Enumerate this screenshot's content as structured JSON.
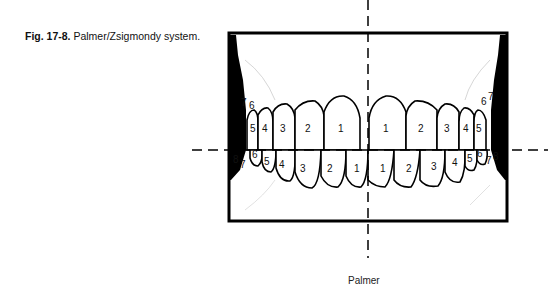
{
  "figure": {
    "number": "Fig. 17-8.",
    "title": "Palmer/Zsigmondy system."
  },
  "diagram": {
    "system_label": "Palmer",
    "upper_right_numbers": [
      "7",
      "6",
      "5",
      "4",
      "3",
      "2",
      "1"
    ],
    "upper_left_numbers": [
      "1",
      "2",
      "3",
      "4",
      "5",
      "6",
      "7"
    ],
    "lower_right_numbers": [
      "8",
      "7",
      "6",
      "5",
      "4",
      "3",
      "2",
      "1"
    ],
    "lower_left_numbers": [
      "1",
      "2",
      "3",
      "4",
      "5",
      "6",
      "7",
      "8"
    ],
    "upper": {
      "right": [
        {
          "n": "7",
          "x": 243,
          "y": 103
        },
        {
          "n": "6",
          "x": 252,
          "y": 107
        },
        {
          "n": "5",
          "x": 255,
          "y": 131
        },
        {
          "n": "4",
          "x": 265,
          "y": 131
        },
        {
          "n": "3",
          "x": 283,
          "y": 131
        },
        {
          "n": "2",
          "x": 308,
          "y": 131
        },
        {
          "n": "1",
          "x": 341,
          "y": 131
        }
      ],
      "left": [
        {
          "n": "1",
          "x": 384,
          "y": 131
        },
        {
          "n": "2",
          "x": 423,
          "y": 131
        },
        {
          "n": "3",
          "x": 450,
          "y": 131
        },
        {
          "n": "4",
          "x": 465,
          "y": 131
        },
        {
          "n": "5",
          "x": 478,
          "y": 131
        },
        {
          "n": "6",
          "x": 481,
          "y": 104
        },
        {
          "n": "7",
          "x": 488,
          "y": 100
        }
      ]
    },
    "lower": {
      "right": [
        {
          "n": "8",
          "x": 235,
          "y": 163
        },
        {
          "n": "7",
          "x": 242,
          "y": 167
        },
        {
          "n": "6",
          "x": 254,
          "y": 157
        },
        {
          "n": "5",
          "x": 264,
          "y": 164
        },
        {
          "n": "4",
          "x": 279,
          "y": 166
        },
        {
          "n": "3",
          "x": 300,
          "y": 172
        },
        {
          "n": "2",
          "x": 327,
          "y": 170
        },
        {
          "n": "1",
          "x": 354,
          "y": 170
        }
      ],
      "left": [
        {
          "n": "1",
          "x": 382,
          "y": 170
        },
        {
          "n": "2",
          "x": 408,
          "y": 170
        },
        {
          "n": "3",
          "x": 432,
          "y": 168
        },
        {
          "n": "4",
          "x": 458,
          "y": 164
        },
        {
          "n": "5",
          "x": 467,
          "y": 161
        },
        {
          "n": "6",
          "x": 478,
          "y": 155
        },
        {
          "n": "7",
          "x": 487,
          "y": 163
        },
        {
          "n": "8",
          "x": 493,
          "y": 159
        }
      ]
    }
  }
}
